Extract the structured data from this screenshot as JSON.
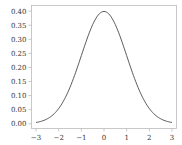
{
  "chart_data": {
    "type": "line",
    "title": "",
    "xlabel": "",
    "ylabel": "",
    "xlim": [
      -3.2,
      3.2
    ],
    "ylim": [
      -0.017,
      0.42
    ],
    "grid": false,
    "legend": null,
    "x_ticks": [
      -3,
      -2,
      -1,
      0,
      1,
      2,
      3
    ],
    "x_tick_labels": [
      "−3",
      "−2",
      "−1",
      "0",
      "1",
      "2",
      "3"
    ],
    "y_ticks": [
      0.0,
      0.05,
      0.1,
      0.15,
      0.2,
      0.25,
      0.3,
      0.35,
      0.4
    ],
    "y_tick_labels": [
      "0.00",
      "0.05",
      "0.10",
      "0.15",
      "0.20",
      "0.25",
      "0.30",
      "0.35",
      "0.40"
    ],
    "series": [
      {
        "name": "standard normal pdf",
        "color": "#333333",
        "x": [
          -3.0,
          -2.5,
          -2.0,
          -1.5,
          -1.0,
          -0.5,
          0.0,
          0.5,
          1.0,
          1.5,
          2.0,
          2.5,
          3.0
        ],
        "y": [
          0.004,
          0.018,
          0.054,
          0.13,
          0.242,
          0.352,
          0.399,
          0.352,
          0.242,
          0.13,
          0.054,
          0.018,
          0.004
        ]
      }
    ]
  }
}
